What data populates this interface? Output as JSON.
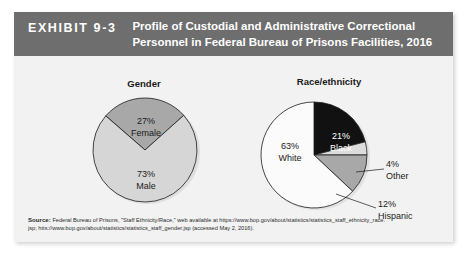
{
  "exhibit": {
    "label": "EXHIBIT 9-3",
    "title_line1": "Profile of Custodial and Administrative Correctional",
    "title_line2": "Personnel in Federal Bureau of Prisons Facilities, 2016",
    "header_bg": "#6e6e6e",
    "header_text_color": "#ffffff",
    "body_bg": "#f2f2f2"
  },
  "source": {
    "label": "Source:",
    "line1": " Federal Bureau of Prisons, \"Staff Ethnicity/Race,\" web available at https://www.bop.gov/about/statistics/statistics_staff_ethnicity_race.",
    "line2": "jsp; htts://www.bop.gov/about/statistics/statistics_staff_gender.jsp (accessed May 2, 2016)."
  },
  "chart_data": [
    {
      "type": "pie",
      "title": "Gender",
      "categories": [
        "Female",
        "Male"
      ],
      "values": [
        27,
        73
      ],
      "value_labels": [
        "27%",
        "73%"
      ],
      "colors": [
        "#a8a8a8",
        "#d6d6d6"
      ],
      "label_text_colors": [
        "#1a1a1a",
        "#1a1a1a"
      ],
      "units": "percent",
      "legend": "none",
      "labels_inside": true
    },
    {
      "type": "pie",
      "title": "Race/ethnicity",
      "categories": [
        "Black",
        "Other",
        "Hispanic",
        "White"
      ],
      "values": [
        21,
        4,
        12,
        63
      ],
      "value_labels": [
        "21%",
        "4%",
        "12%",
        "63%"
      ],
      "colors": [
        "#111111",
        "#dcdcdc",
        "#a8a8a8",
        "#fbfbfb"
      ],
      "label_text_colors": [
        "#ffffff",
        "#1a1a1a",
        "#1a1a1a",
        "#1a1a1a"
      ],
      "units": "percent",
      "legend": "none",
      "labels_inside": false,
      "leader_lines": [
        "Other",
        "Hispanic"
      ]
    }
  ]
}
